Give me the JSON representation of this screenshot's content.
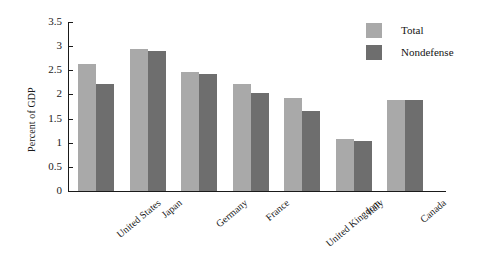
{
  "chart_data": {
    "type": "bar",
    "title": "",
    "subtitle": "",
    "xlabel": "",
    "ylabel": "Percent of GDP",
    "ylim": [
      0,
      3.5
    ],
    "yticks": [
      0,
      0.5,
      1,
      1.5,
      2,
      2.5,
      3,
      3.5
    ],
    "ytick_labels": [
      "0",
      "0.5",
      "1",
      "1.5",
      "2",
      "2.5",
      "3",
      "3.5"
    ],
    "grid": false,
    "legend_position": "top-right",
    "categories": [
      "United States",
      "Japan",
      "Germany",
      "France",
      "United Kingdom",
      "Italy",
      "Canada"
    ],
    "series": [
      {
        "name": "Total",
        "color": "#a9a9a9",
        "values": [
          2.63,
          2.95,
          2.47,
          2.22,
          1.93,
          1.08,
          1.88
        ]
      },
      {
        "name": "Nondefense",
        "color": "#6e6e6e",
        "values": [
          2.21,
          2.9,
          2.42,
          2.03,
          1.65,
          1.03,
          1.88
        ]
      }
    ],
    "annotations": []
  },
  "legend": {
    "items": [
      {
        "label": "Total",
        "color": "#a9a9a9"
      },
      {
        "label": "Nondefense",
        "color": "#6e6e6e"
      }
    ]
  },
  "colors": {
    "total": "#a9a9a9",
    "nondefense": "#6e6e6e",
    "axis": "#1a1a1a",
    "background": "#ffffff"
  }
}
